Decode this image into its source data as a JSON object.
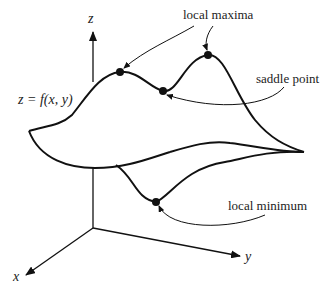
{
  "figure": {
    "equation": "z = f(x, y)",
    "axes": {
      "x": "x",
      "y": "y",
      "z": "z"
    },
    "annotations": {
      "local_maxima": "local maxima",
      "saddle_point": "saddle point",
      "local_minimum": "local minimum"
    },
    "colors": {
      "stroke": "#111111",
      "text": "#222222",
      "background": "#ffffff"
    }
  }
}
